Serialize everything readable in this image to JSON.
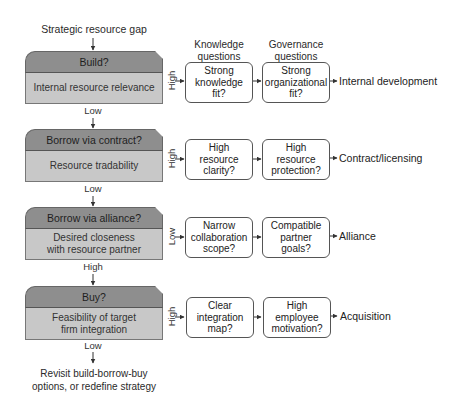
{
  "diagram": {
    "start_label": "Strategic resource gap",
    "column_headers": {
      "knowledge": "Knowledge\nquestions",
      "knowledge_line1": "Knowledge",
      "knowledge_line2": "questions",
      "governance_line1": "Governance",
      "governance_line2": "questions"
    },
    "stages": [
      {
        "header": "Build?",
        "criterion": "Internal resource relevance",
        "branch_label": "High",
        "knowledge_q": "Strong\nknowledge\nfit?",
        "governance_q": "Strong\norganizational\nfit?",
        "outcome": "Internal development",
        "down_label": "Low"
      },
      {
        "header": "Borrow via contract?",
        "criterion": "Resource tradability",
        "branch_label": "High",
        "knowledge_q": "High\nresource\nclarity?",
        "governance_q": "High\nresource\nprotection?",
        "outcome": "Contract/licensing",
        "down_label": "Low"
      },
      {
        "header": "Borrow via alliance?",
        "criterion": "Desired closeness with resource partner",
        "branch_label": "Low",
        "knowledge_q": "Narrow\ncollaboration\nscope?",
        "governance_q": "Compatible\npartner\ngoals?",
        "outcome": "Alliance",
        "down_label": "High"
      },
      {
        "header": "Buy?",
        "criterion": "Feasibility of target firm integration",
        "branch_label": "High",
        "knowledge_q": "Clear\nintegration\nmap?",
        "governance_q": "High\nemployee\nmotivation?",
        "outcome": "Acquisition",
        "down_label": "Low"
      }
    ],
    "end_label_line1": "Revisit build-borrow-buy",
    "end_label_line2": "options, or redefine strategy",
    "colors": {
      "header_fill": "#8e8e8e",
      "body_fill": "#c8c8c8",
      "stroke": "#555555",
      "text": "#222222"
    }
  }
}
